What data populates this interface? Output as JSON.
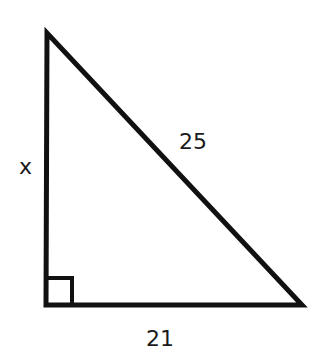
{
  "diagram": {
    "type": "right-triangle",
    "vertices": {
      "top": [
        47,
        32
      ],
      "right_angle": [
        46,
        305
      ],
      "bottom_right": [
        302,
        305
      ]
    },
    "labels": {
      "vertical_leg": "x",
      "hypotenuse": "25",
      "horizontal_leg": "21"
    },
    "right_angle_marker": true,
    "stroke_color": "#111111"
  }
}
